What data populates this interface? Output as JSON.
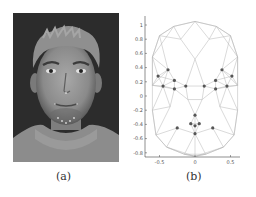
{
  "figure": {
    "panels": [
      {
        "id": "a",
        "caption": "(a)",
        "content": "grayscale frontal face photograph of a young man with short spiky hair and a turtleneck sweater, with small landmark dots on the face"
      },
      {
        "id": "b",
        "caption": "(b)",
        "content": "triangulated 2D face mesh with highlighted landmark points"
      }
    ]
  },
  "chart_data": {
    "type": "scatter",
    "title": "",
    "xlabel": "",
    "ylabel": "",
    "xlim": [
      -0.65,
      0.65
    ],
    "ylim": [
      -0.85,
      1.1
    ],
    "x_ticks": [
      "-0.5",
      "0",
      "0.5"
    ],
    "y_ticks": [
      "1",
      "0.8",
      "0.6",
      "0.4",
      "0.2",
      "0",
      "-0.2",
      "-0.4",
      "-0.6",
      "-0.8"
    ],
    "grid": false,
    "legend": null,
    "mesh_color": "#b0b0b0",
    "landmark_color": "#555555",
    "series": [
      {
        "name": "landmarks",
        "points": [
          [
            -0.38,
            0.37
          ],
          [
            -0.52,
            0.28
          ],
          [
            -0.45,
            0.14
          ],
          [
            -0.29,
            0.22
          ],
          [
            -0.29,
            0.1
          ],
          [
            -0.13,
            0.14
          ],
          [
            0.38,
            0.37
          ],
          [
            0.52,
            0.28
          ],
          [
            0.45,
            0.14
          ],
          [
            0.29,
            0.22
          ],
          [
            0.29,
            0.1
          ],
          [
            0.13,
            0.14
          ],
          [
            0.0,
            -0.27
          ],
          [
            -0.06,
            -0.39
          ],
          [
            0.06,
            -0.39
          ],
          [
            0.0,
            -0.42
          ],
          [
            -0.25,
            -0.45
          ],
          [
            0.25,
            -0.45
          ],
          [
            0.0,
            -0.53
          ]
        ]
      },
      {
        "name": "mesh-vertices",
        "points": [
          [
            0.0,
            1.05
          ],
          [
            -0.3,
            0.98
          ],
          [
            0.3,
            0.98
          ],
          [
            -0.5,
            0.85
          ],
          [
            0.5,
            0.85
          ],
          [
            -0.6,
            0.55
          ],
          [
            0.6,
            0.55
          ],
          [
            -0.2,
            0.8
          ],
          [
            0.2,
            0.8
          ],
          [
            0.0,
            0.52
          ],
          [
            -0.6,
            0.15
          ],
          [
            0.6,
            0.15
          ],
          [
            -0.6,
            -0.2
          ],
          [
            0.6,
            -0.2
          ],
          [
            -0.55,
            -0.55
          ],
          [
            0.55,
            -0.55
          ],
          [
            -0.4,
            -0.72
          ],
          [
            0.4,
            -0.72
          ],
          [
            -0.15,
            -0.82
          ],
          [
            0.15,
            -0.82
          ],
          [
            0.0,
            -0.85
          ],
          [
            -0.1,
            -0.05
          ],
          [
            0.1,
            -0.05
          ],
          [
            -0.35,
            -0.15
          ],
          [
            0.35,
            -0.15
          ]
        ]
      }
    ]
  }
}
